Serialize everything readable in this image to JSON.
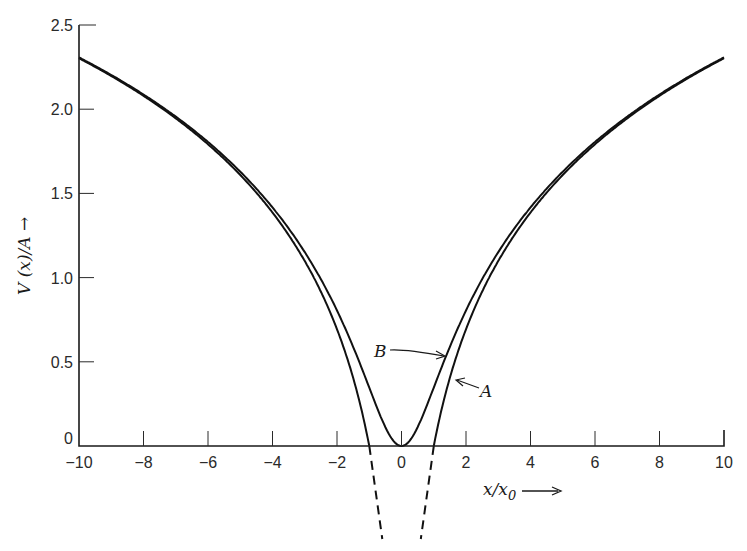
{
  "chart_data": {
    "type": "line",
    "title": "",
    "xlabel": "x/x0",
    "ylabel": "V(x)/A",
    "xlim": [
      -10,
      10
    ],
    "ylim": [
      0,
      2.5
    ],
    "grid": false,
    "x_ticks": [
      -10,
      -8,
      -6,
      -4,
      -2,
      0,
      2,
      4,
      6,
      8,
      10
    ],
    "x_tick_labels": [
      "−10",
      "−8",
      "−6",
      "−4",
      "−2",
      "0",
      "2",
      "4",
      "6",
      "8",
      "10"
    ],
    "y_ticks": [
      0,
      0.5,
      1.0,
      1.5,
      2.0,
      2.5
    ],
    "y_tick_labels": [
      "0",
      "0.5",
      "1.0",
      "1.5",
      "2.0",
      "2.5"
    ],
    "series": [
      {
        "name": "A",
        "description": "ln|x/x0|, solid for |x|>=1, dashed below the axis",
        "x": [
          -10,
          -8,
          -6,
          -4,
          -3,
          -2,
          -1.5,
          -1,
          1,
          1.5,
          2,
          3,
          4,
          6,
          8,
          10
        ],
        "values": [
          2.3,
          2.08,
          1.79,
          1.39,
          1.1,
          0.69,
          0.41,
          0.0,
          0.0,
          0.41,
          0.69,
          1.1,
          1.39,
          1.79,
          2.08,
          2.3
        ]
      },
      {
        "name": "B",
        "description": "0.5 ln(1+(x/x0)^2)",
        "x": [
          -10,
          -8,
          -6,
          -4,
          -3,
          -2,
          -1,
          -0.5,
          0,
          0.5,
          1,
          2,
          3,
          4,
          6,
          8,
          10
        ],
        "values": [
          2.31,
          2.09,
          1.8,
          1.42,
          1.15,
          0.8,
          0.35,
          0.11,
          0.0,
          0.11,
          0.35,
          0.8,
          1.15,
          1.42,
          1.8,
          2.09,
          2.31
        ]
      }
    ],
    "annotations": [
      {
        "text": "A",
        "points_to": "series A near x=1.4"
      },
      {
        "text": "B",
        "points_to": "series B near x=1.3"
      }
    ],
    "legend": "none (inline arrow labels)"
  },
  "labels": {
    "ylabel_text": "V (x)/A →",
    "xlabel_main": "x/x",
    "xlabel_sub": "0",
    "annotation_a": "A",
    "annotation_b": "B"
  }
}
